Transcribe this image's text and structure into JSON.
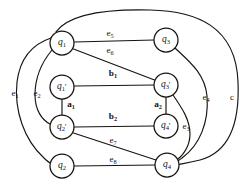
{
  "figure": {
    "type": "undirected-graph-diagram",
    "background_color": "#ffffff",
    "ink_color": "#17140f",
    "width": 245,
    "height": 187
  },
  "nodes": [
    {
      "id": "q1",
      "base": "q",
      "sub": "1",
      "prime": false,
      "label": "q1",
      "cx": 62,
      "cy": 43,
      "r": 12
    },
    {
      "id": "q1p",
      "base": "q",
      "sub": "1",
      "prime": true,
      "label": "q1'",
      "cx": 62,
      "cy": 87,
      "r": 12
    },
    {
      "id": "q2p",
      "base": "q",
      "sub": "2",
      "prime": true,
      "label": "q2'",
      "cx": 62,
      "cy": 127,
      "r": 12
    },
    {
      "id": "q2",
      "base": "q",
      "sub": "2",
      "prime": false,
      "label": "q2",
      "cx": 62,
      "cy": 166,
      "r": 12
    },
    {
      "id": "q3",
      "base": "q",
      "sub": "3",
      "prime": false,
      "label": "q3",
      "cx": 166,
      "cy": 40,
      "r": 12
    },
    {
      "id": "q3p",
      "base": "q",
      "sub": "3",
      "prime": true,
      "label": "q3'",
      "cx": 166,
      "cy": 85,
      "r": 12
    },
    {
      "id": "q4p",
      "base": "q",
      "sub": "4",
      "prime": true,
      "label": "q4'",
      "cx": 166,
      "cy": 126,
      "r": 12
    },
    {
      "id": "q4",
      "base": "q",
      "sub": "4",
      "prime": false,
      "label": "q4",
      "cx": 167,
      "cy": 165,
      "r": 12
    }
  ],
  "edges": [
    {
      "id": "e5",
      "label": "e5",
      "base": "e",
      "sub": "5",
      "from": "q1",
      "to": "q3",
      "style": "straight"
    },
    {
      "id": "e6",
      "label": "e6",
      "base": "e",
      "sub": "6",
      "from": "q1",
      "to": "q3p",
      "style": "straight"
    },
    {
      "id": "b1",
      "label": "b1",
      "base": "b",
      "sub": "1",
      "from": "q1p",
      "to": "q3p",
      "style": "straight"
    },
    {
      "id": "a1",
      "label": "a1",
      "base": "a",
      "sub": "1",
      "from": "q1p",
      "to": "q2p",
      "style": "straight"
    },
    {
      "id": "b2",
      "label": "b2",
      "base": "b",
      "sub": "2",
      "from": "q2p",
      "to": "q4p",
      "style": "straight"
    },
    {
      "id": "a2",
      "label": "a2",
      "base": "a",
      "sub": "2",
      "from": "q3p",
      "to": "q4p",
      "style": "straight"
    },
    {
      "id": "e7",
      "label": "e7",
      "base": "e",
      "sub": "7",
      "from": "q2p",
      "to": "q4",
      "style": "straight"
    },
    {
      "id": "e8",
      "label": "e8",
      "base": "e",
      "sub": "8",
      "from": "q2",
      "to": "q4",
      "style": "straight"
    },
    {
      "id": "e1",
      "label": "e1",
      "base": "e",
      "sub": "1",
      "from": "q1",
      "to": "q2",
      "style": "curved-left-outer"
    },
    {
      "id": "e2",
      "label": "e2",
      "base": "e",
      "sub": "2",
      "from": "q1",
      "to": "q2p",
      "style": "curved-left-inner"
    },
    {
      "id": "e3",
      "label": "e3",
      "base": "e",
      "sub": "3",
      "from": "q3p",
      "to": "q4",
      "style": "curved-right-inner"
    },
    {
      "id": "e4",
      "label": "e4",
      "base": "e",
      "sub": "4",
      "from": "q3",
      "to": "q4",
      "style": "curved-right-mid"
    },
    {
      "id": "c",
      "label": "c",
      "base": "c",
      "sub": "",
      "from": "q1",
      "to": "q4",
      "style": "curved-outer-top"
    }
  ],
  "edge_labels": [
    {
      "id": "e5",
      "text_base": "e",
      "text_sub": "5",
      "x": 110,
      "y": 33,
      "bold": false
    },
    {
      "id": "e6",
      "text_base": "e",
      "text_sub": "6",
      "x": 110,
      "y": 50,
      "bold": false
    },
    {
      "id": "b1",
      "text_base": "b",
      "text_sub": "1",
      "x": 113,
      "y": 74,
      "bold": true
    },
    {
      "id": "a1",
      "text_base": "a",
      "text_sub": "1",
      "x": 71,
      "y": 105,
      "bold": true
    },
    {
      "id": "b2",
      "text_base": "b",
      "text_sub": "2",
      "x": 113,
      "y": 117,
      "bold": true
    },
    {
      "id": "a2",
      "text_base": "a",
      "text_sub": "2",
      "x": 158,
      "y": 105,
      "bold": true
    },
    {
      "id": "e7",
      "text_base": "e",
      "text_sub": "7",
      "x": 113,
      "y": 140,
      "bold": false
    },
    {
      "id": "e8",
      "text_base": "e",
      "text_sub": "8",
      "x": 113,
      "y": 159,
      "bold": false
    },
    {
      "id": "e1",
      "text_base": "e",
      "text_sub": "1",
      "x": 15,
      "y": 93,
      "bold": false
    },
    {
      "id": "e2",
      "text_base": "e",
      "text_sub": "2",
      "x": 37,
      "y": 93,
      "bold": false
    },
    {
      "id": "e3",
      "text_base": "e",
      "text_sub": "3",
      "x": 186,
      "y": 126,
      "bold": false
    },
    {
      "id": "e4",
      "text_base": "e",
      "text_sub": "4",
      "x": 206,
      "y": 97,
      "bold": false
    },
    {
      "id": "c",
      "text_base": "c",
      "text_sub": "",
      "x": 232,
      "y": 97,
      "bold": false
    }
  ]
}
